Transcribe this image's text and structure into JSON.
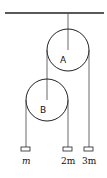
{
  "diagram": {
    "type": "pulley-system",
    "pulleys": [
      {
        "id": "A",
        "label": "A"
      },
      {
        "id": "B",
        "label": "B"
      }
    ],
    "masses": [
      {
        "id": "m1",
        "label": "m"
      },
      {
        "id": "m2",
        "label": "2m"
      },
      {
        "id": "m3",
        "label": "3m"
      }
    ],
    "colors": {
      "line": "#222222",
      "background": "#ffffff"
    }
  }
}
